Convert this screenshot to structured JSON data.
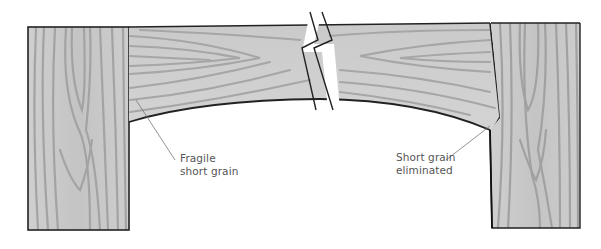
{
  "figure": {
    "colors": {
      "wood_light": "#c9c9c9",
      "wood_grain": "#9e9e9e",
      "outline": "#222222",
      "leader": "#777777",
      "background": "#ffffff"
    }
  },
  "labels": {
    "left": {
      "line1": "Fragile",
      "line2": "short grain"
    },
    "right": {
      "line1": "Short grain",
      "line2": "eliminated"
    }
  }
}
